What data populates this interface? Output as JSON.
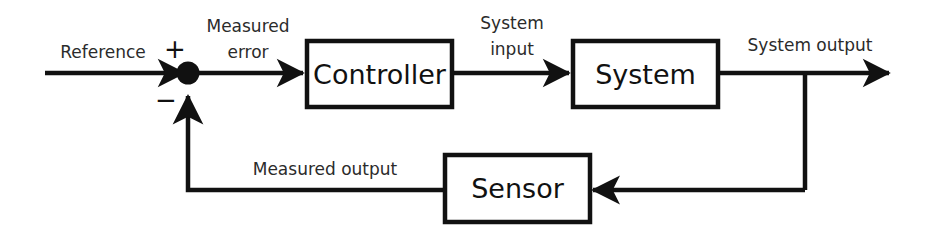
{
  "diagram": {
    "type": "block-diagram",
    "stroke_color": "#111111",
    "fill_color": "#ffffff",
    "background_color": "#ffffff",
    "blocks": [
      {
        "id": "controller",
        "label": "Controller"
      },
      {
        "id": "system",
        "label": "System"
      },
      {
        "id": "sensor",
        "label": "Sensor"
      }
    ],
    "junction": {
      "id": "summing-junction",
      "plus_sign": "+",
      "minus_sign": "−"
    },
    "signals": [
      {
        "id": "reference",
        "label": "Reference"
      },
      {
        "id": "measured-error-line1",
        "label": "Measured"
      },
      {
        "id": "measured-error-line2",
        "label": "error"
      },
      {
        "id": "system-input-line1",
        "label": "System"
      },
      {
        "id": "system-input-line2",
        "label": "input"
      },
      {
        "id": "system-output",
        "label": "System output"
      },
      {
        "id": "measured-output",
        "label": "Measured output"
      }
    ]
  }
}
